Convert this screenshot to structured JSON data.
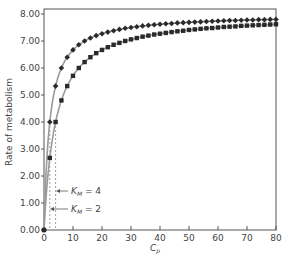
{
  "chart_data": {
    "type": "line",
    "title": "",
    "xlabel": "C_p",
    "ylabel": "Rate of metabolism",
    "xlim": [
      0,
      80
    ],
    "ylim": [
      0,
      8
    ],
    "x_ticks": [
      "0",
      "10",
      "20",
      "30",
      "40",
      "50",
      "60",
      "70",
      "80"
    ],
    "y_ticks": [
      "0.00",
      "1.00",
      "2.00",
      "3.00",
      "4.00",
      "5.00",
      "6.00",
      "7.00",
      "8.00"
    ],
    "grid": false,
    "legend": null,
    "x": [
      0,
      2,
      4,
      6,
      8,
      10,
      12,
      14,
      16,
      18,
      20,
      22,
      24,
      26,
      28,
      30,
      32,
      34,
      36,
      38,
      40,
      42,
      44,
      46,
      48,
      50,
      52,
      54,
      56,
      58,
      60,
      62,
      64,
      66,
      68,
      70,
      72,
      74,
      76,
      78,
      80
    ],
    "series": [
      {
        "name": "K_M = 2",
        "marker": "diamond",
        "values": [
          0,
          4.0,
          5.33,
          6.0,
          6.4,
          6.67,
          6.86,
          7.0,
          7.11,
          7.2,
          7.27,
          7.33,
          7.38,
          7.43,
          7.47,
          7.5,
          7.53,
          7.56,
          7.58,
          7.6,
          7.62,
          7.64,
          7.65,
          7.67,
          7.68,
          7.69,
          7.7,
          7.71,
          7.72,
          7.73,
          7.74,
          7.75,
          7.76,
          7.76,
          7.77,
          7.78,
          7.78,
          7.79,
          7.79,
          7.8,
          7.8
        ]
      },
      {
        "name": "K_M = 4",
        "marker": "square",
        "values": [
          0,
          2.67,
          4.0,
          4.8,
          5.33,
          5.71,
          6.0,
          6.22,
          6.4,
          6.55,
          6.67,
          6.77,
          6.86,
          6.93,
          7.0,
          7.06,
          7.11,
          7.16,
          7.2,
          7.24,
          7.27,
          7.3,
          7.33,
          7.36,
          7.38,
          7.41,
          7.43,
          7.45,
          7.47,
          7.48,
          7.5,
          7.52,
          7.53,
          7.54,
          7.56,
          7.57,
          7.58,
          7.59,
          7.6,
          7.61,
          7.62
        ]
      }
    ],
    "annotations": [
      {
        "text": "K_M = 4",
        "points_to_x": 4,
        "style": "dashed vertical line at C_p = 4 with arrow"
      },
      {
        "text": "K_M = 2",
        "points_to_x": 2,
        "style": "dashed vertical line at C_p = 2 with arrow"
      }
    ],
    "vmax": 8
  },
  "labels": {
    "ylabel": "Rate of metabolism",
    "xlabel_main": "C",
    "xlabel_sub": "p",
    "km4_main": "K",
    "km4_sub": "M",
    "km4_value": " = 4",
    "km2_main": "K",
    "km2_sub": "M",
    "km2_value": " = 2"
  },
  "colors": {
    "curve": "#9a9a9a",
    "marker": "#2a2a2a",
    "axis": "#555555",
    "dashed": "#888888"
  }
}
